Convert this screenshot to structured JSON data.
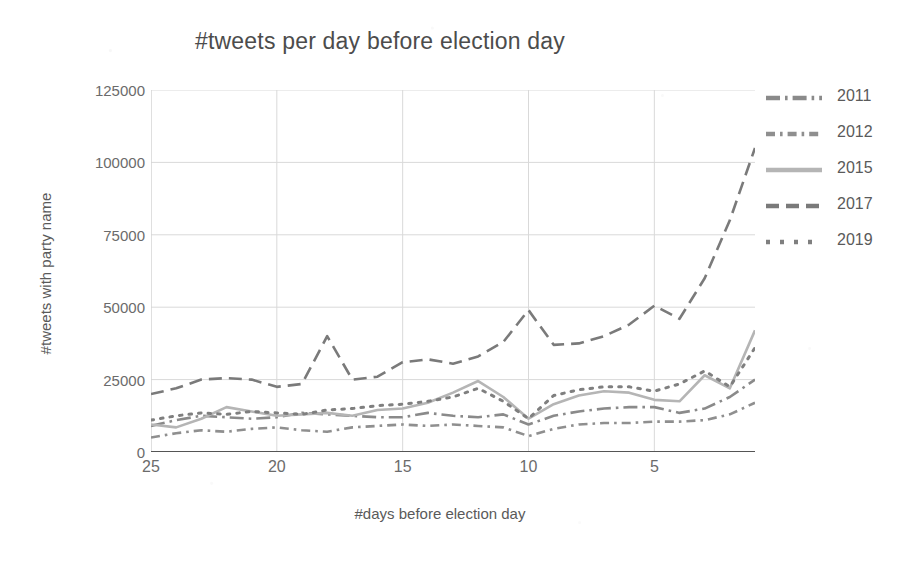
{
  "chart_data": {
    "type": "line",
    "title": "#tweets per day before election day",
    "xlabel": "#days before election day",
    "ylabel": "#tweets with party name",
    "grid": true,
    "legend_position": "right",
    "xlim": [
      25,
      1
    ],
    "ylim": [
      0,
      125000
    ],
    "x_reversed": true,
    "xticks": [
      25,
      20,
      15,
      10,
      5
    ],
    "yticks": [
      0,
      25000,
      50000,
      75000,
      100000,
      125000
    ],
    "ytick_labels": [
      "0",
      "25000",
      "50000",
      "75000",
      "100000",
      "125000"
    ],
    "x": [
      25,
      24,
      23,
      22,
      21,
      20,
      19,
      18,
      17,
      16,
      15,
      14,
      13,
      12,
      11,
      10,
      9,
      8,
      7,
      6,
      5,
      4,
      3,
      2,
      1
    ],
    "series": [
      {
        "name": "2011",
        "style": "dash-dot",
        "color": "#8a8a8a",
        "values": [
          9000,
          11000,
          12500,
          12000,
          11500,
          12000,
          13500,
          13000,
          12500,
          12000,
          12000,
          13500,
          12500,
          12000,
          13000,
          9500,
          12500,
          14000,
          15000,
          15500,
          15500,
          13500,
          15000,
          19000,
          25000
        ]
      },
      {
        "name": "2012",
        "style": "dash-dot-short",
        "color": "#8f8f8f",
        "values": [
          5000,
          6500,
          7500,
          7000,
          8000,
          8500,
          7500,
          7000,
          8500,
          9000,
          9500,
          9000,
          9500,
          9000,
          8500,
          5500,
          8000,
          9500,
          10000,
          10000,
          10500,
          10500,
          11000,
          13000,
          17000
        ]
      },
      {
        "name": "2015",
        "style": "solid",
        "color": "#b5b5b5",
        "values": [
          9500,
          8500,
          11500,
          15500,
          14000,
          12500,
          13000,
          13500,
          12500,
          14500,
          15000,
          17000,
          20500,
          24500,
          19000,
          11500,
          16500,
          19500,
          21000,
          20500,
          18000,
          17500,
          26500,
          22000,
          42000
        ]
      },
      {
        "name": "2017",
        "style": "dash",
        "color": "#7a7a7a",
        "values": [
          20000,
          22000,
          25000,
          25500,
          25000,
          22500,
          23500,
          40000,
          25000,
          26000,
          31000,
          32000,
          30500,
          33000,
          38000,
          49000,
          37000,
          37500,
          40000,
          44000,
          50500,
          46000,
          60000,
          80000,
          105000
        ]
      },
      {
        "name": "2019",
        "style": "dot",
        "color": "#7f7f7f",
        "values": [
          11000,
          12500,
          13500,
          13000,
          14000,
          13500,
          13000,
          14500,
          15000,
          16000,
          16500,
          17500,
          19000,
          22000,
          17500,
          11500,
          19500,
          21500,
          22500,
          22500,
          21000,
          23500,
          28000,
          22500,
          36000
        ]
      }
    ]
  },
  "legend": {
    "items": [
      {
        "label": "2011"
      },
      {
        "label": "2012"
      },
      {
        "label": "2015"
      },
      {
        "label": "2017"
      },
      {
        "label": "2019"
      }
    ]
  }
}
